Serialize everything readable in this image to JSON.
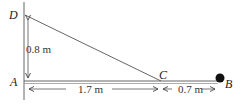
{
  "diagram": {
    "type": "physics-geometry",
    "points": {
      "A": {
        "label": "A"
      },
      "B": {
        "label": "B"
      },
      "C": {
        "label": "C"
      },
      "D": {
        "label": "D"
      }
    },
    "dimensions": {
      "AD": "0.8 m",
      "AC": "1.7 m",
      "CB": "0.7 m"
    },
    "objects": {
      "ball": {
        "at": "B",
        "color": "#111111"
      }
    },
    "colors": {
      "line": "#555555",
      "text": "#222222"
    }
  }
}
